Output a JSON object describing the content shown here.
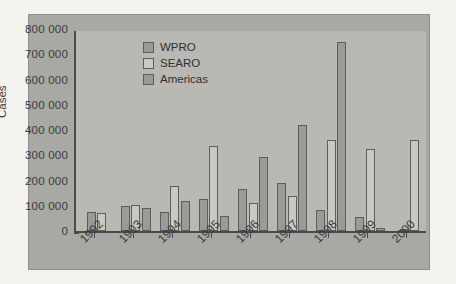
{
  "chart_data": {
    "type": "bar",
    "title": "",
    "xlabel": "",
    "ylabel": "Cases",
    "ylim": [
      0,
      800000
    ],
    "ytick_labels": [
      "800 000",
      "700 000",
      "600 000",
      "500 000",
      "400 000",
      "300 000",
      "200 000",
      "100 000",
      "0"
    ],
    "ytick_values": [
      800000,
      700000,
      600000,
      500000,
      400000,
      300000,
      200000,
      100000,
      0
    ],
    "categories": [
      "1992",
      "1993",
      "1994",
      "1995",
      "1996",
      "1997",
      "1998",
      "1999",
      "2000"
    ],
    "grid": false,
    "legend_position": "top-center",
    "series": [
      {
        "name": "WPRO",
        "color": "#9a9a96",
        "values": [
          75000,
          100000,
          75000,
          125000,
          165000,
          190000,
          85000,
          55000,
          5000
        ]
      },
      {
        "name": "SEARO",
        "color": "#c9c9c4",
        "values": [
          70000,
          105000,
          180000,
          335000,
          110000,
          140000,
          360000,
          325000,
          360000
        ]
      },
      {
        "name": "Americas",
        "color": "#9a9a96",
        "values": [
          null,
          90000,
          120000,
          60000,
          295000,
          420000,
          750000,
          10000,
          null
        ]
      }
    ]
  },
  "legend": {
    "items": [
      {
        "label": "WPRO"
      },
      {
        "label": "SEARO"
      },
      {
        "label": "Americas"
      }
    ]
  },
  "colors": {
    "figure_background": "#a8a8a4",
    "panel_background": "#b9b9b4",
    "axis": "#4a4a48",
    "text": "#3b3b39",
    "page_background": "#f4f3ef"
  }
}
